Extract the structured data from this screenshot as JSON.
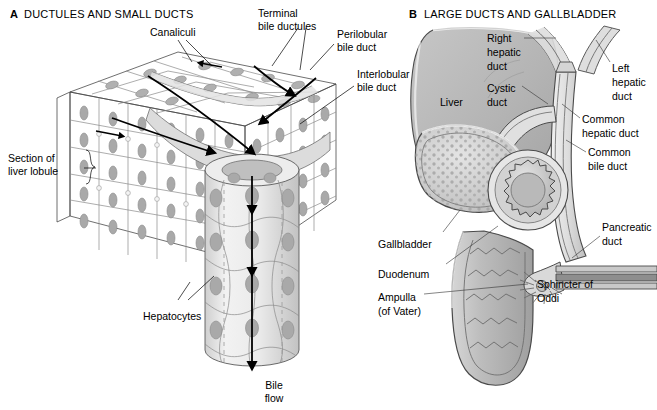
{
  "figure": {
    "background_color": "#ffffff",
    "text_color": "#000000"
  },
  "colors": {
    "liver_fill": "#b7b7b7",
    "liver_fill_dark": "#a2a2a2",
    "liver_fill_light": "#c9c9c9",
    "duct_fill": "#dcdcdc",
    "duct_fill_light": "#ececec",
    "cell_fill": "#d2d2d2",
    "cell_fill_light": "#e6e6e6",
    "cell_fill_dark": "#bdbdbd",
    "nucleus_fill": "#a8a8a8",
    "outline": "#4a4a4a",
    "cell_outline": "#8a8a8a",
    "arrow": "#000000",
    "duodenum_fill": "#c4c4c4",
    "stipple": "#a9a9a9"
  },
  "panels": [
    {
      "letter": "A",
      "title": "DUCTULES AND SMALL DUCTS",
      "letter_pos": {
        "x": 10,
        "y": 18
      },
      "title_pos": {
        "x": 24,
        "y": 18
      },
      "labels": [
        {
          "name": "canaliculi",
          "lines": [
            "Canaliculi"
          ],
          "x": 150,
          "y": 32,
          "anchor": "start"
        },
        {
          "name": "terminal-bile-ductules",
          "lines": [
            "Terminal",
            "bile ductules"
          ],
          "x": 258,
          "y": 16,
          "anchor": "start"
        },
        {
          "name": "perilobular-bile-duct",
          "lines": [
            "Perilobular",
            "bile duct"
          ],
          "x": 337,
          "y": 33,
          "anchor": "start"
        },
        {
          "name": "interlobular-bile-duct",
          "lines": [
            "Interlobular",
            "bile duct"
          ],
          "x": 357,
          "y": 75,
          "anchor": "start"
        },
        {
          "name": "section-of-liver-lobule",
          "lines": [
            "Section of",
            "liver lobule"
          ],
          "x": 8,
          "y": 159,
          "anchor": "start"
        },
        {
          "name": "hepatocytes",
          "lines": [
            "Hepatocytes"
          ],
          "x": 143,
          "y": 317,
          "anchor": "start"
        },
        {
          "name": "bile-flow",
          "lines": [
            "Bile",
            "flow"
          ],
          "x": 274,
          "y": 386,
          "anchor": "middle"
        }
      ]
    },
    {
      "letter": "B",
      "title": "LARGE DUCTS AND GALLBLADDER",
      "letter_pos": {
        "x": 409,
        "y": 18
      },
      "title_pos": {
        "x": 424,
        "y": 18
      },
      "labels": [
        {
          "name": "right-hepatic-duct",
          "lines": [
            "Right",
            "hepatic",
            "duct"
          ],
          "x": 487,
          "y": 42,
          "anchor": "start"
        },
        {
          "name": "left-hepatic-duct",
          "lines": [
            "Left",
            "hepatic",
            "duct"
          ],
          "x": 612,
          "y": 69,
          "anchor": "start"
        },
        {
          "name": "cystic-duct",
          "lines": [
            "Cystic",
            "duct"
          ],
          "x": 487,
          "y": 89,
          "anchor": "start"
        },
        {
          "name": "liver",
          "lines": [
            "Liver"
          ],
          "x": 440,
          "y": 103,
          "anchor": "start"
        },
        {
          "name": "common-hepatic-duct",
          "lines": [
            "Common",
            "hepatic duct"
          ],
          "x": 582,
          "y": 120,
          "anchor": "start"
        },
        {
          "name": "common-bile-duct",
          "lines": [
            "Common",
            "bile duct"
          ],
          "x": 588,
          "y": 153,
          "anchor": "start"
        },
        {
          "name": "pancreatic-duct",
          "lines": [
            "Pancreatic",
            "duct"
          ],
          "x": 602,
          "y": 228,
          "anchor": "start"
        },
        {
          "name": "gallbladder",
          "lines": [
            "Gallbladder"
          ],
          "x": 378,
          "y": 245,
          "anchor": "start"
        },
        {
          "name": "duodenum",
          "lines": [
            "Duodenum"
          ],
          "x": 378,
          "y": 275,
          "anchor": "start"
        },
        {
          "name": "ampulla-of-vater",
          "lines": [
            "Ampulla",
            "(of Vater)"
          ],
          "x": 378,
          "y": 298,
          "anchor": "start"
        },
        {
          "name": "sphincter-of-oddi",
          "lines": [
            "Sphincter of",
            "Oddi"
          ],
          "x": 537,
          "y": 285,
          "anchor": "start"
        }
      ]
    }
  ]
}
